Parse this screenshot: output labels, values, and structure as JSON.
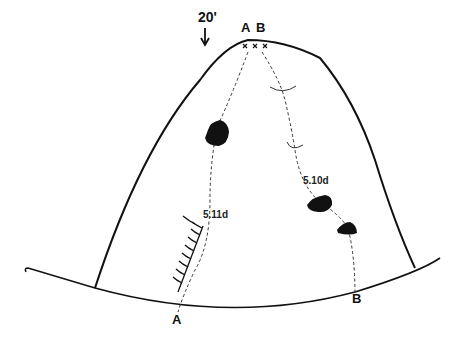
{
  "diagram": {
    "type": "climbing-route-topo",
    "height_marker": {
      "label": "20'",
      "icon": "down-arrow-icon"
    },
    "routes": [
      {
        "id": "A",
        "top_label": "A",
        "bottom_label": "A",
        "grade": "5.11d"
      },
      {
        "id": "B",
        "top_label": "B",
        "bottom_label": "B",
        "grade": "5.10d"
      }
    ],
    "anchors": {
      "symbol": "x x x",
      "count": 3
    },
    "features": {
      "roof_overhang": "hatched-roof-feature",
      "holds": 3,
      "bolt_hangers": 2
    },
    "colors": {
      "ink": "#111111",
      "background": "#ffffff",
      "dashes": "#333333"
    }
  }
}
